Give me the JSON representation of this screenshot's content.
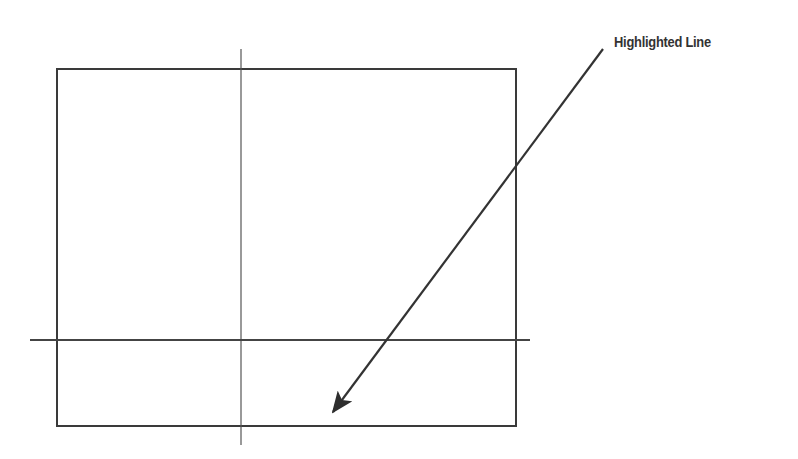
{
  "diagram": {
    "annotation": {
      "label": "Highlighted Line",
      "text_color": "#333333"
    },
    "colors": {
      "stroke": "#3a3a3a",
      "thin_stroke": "#555555",
      "background": "#ffffff"
    },
    "shapes": {
      "rectangle": {
        "x": 57,
        "y": 69,
        "width": 459,
        "height": 357
      },
      "vertical_line": {
        "x": 241,
        "y1": 49,
        "y2": 445
      },
      "horizontal_line": {
        "y": 340,
        "x1": 30,
        "x2": 530
      },
      "arrow": {
        "x1": 603,
        "y1": 49,
        "x2": 330,
        "y2": 416
      }
    }
  }
}
